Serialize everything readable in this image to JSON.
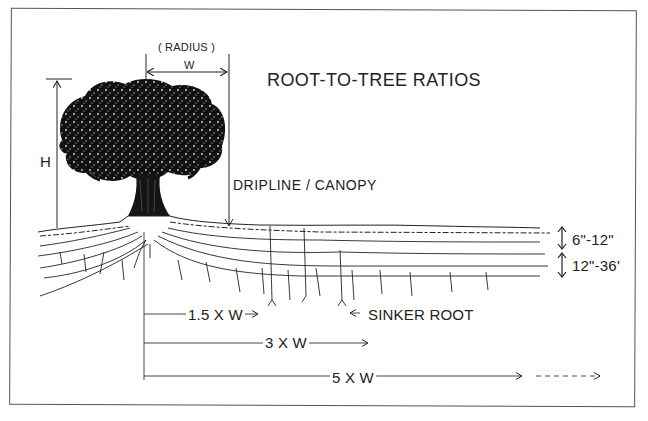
{
  "diagram": {
    "title": "ROOT-TO-TREE RATIOS",
    "canopy": {
      "radius_label": "( RADIUS )",
      "width_label": "W",
      "height_label": "H",
      "dripline_label": "DRIPLINE / CANOPY"
    },
    "soil_depths": [
      {
        "label": "6\"-12\""
      },
      {
        "label": "12\"-36'"
      }
    ],
    "root_spread": [
      {
        "label": "1.5 X W"
      },
      {
        "label": "3 X W"
      },
      {
        "label": "5 X W"
      }
    ],
    "callouts": {
      "sinker_root": "SINKER ROOT"
    },
    "colors": {
      "ink": "#1a1a1a",
      "paper": "#ffffff",
      "frame": "#555555"
    }
  }
}
